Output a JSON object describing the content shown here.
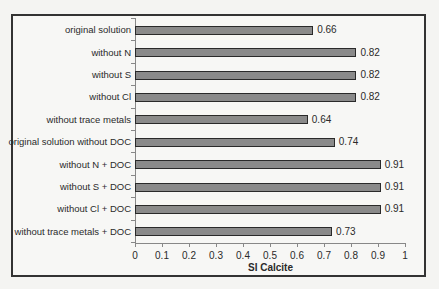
{
  "chart_data": {
    "type": "bar",
    "orientation": "horizontal",
    "title": "",
    "xlabel": "SI Calcite",
    "ylabel": "",
    "xlim": [
      0,
      1
    ],
    "xticks": [
      "0",
      "0.1",
      "0.2",
      "0.3",
      "0.4",
      "0.5",
      "0.6",
      "0.7",
      "0.8",
      "0.9",
      "1"
    ],
    "grid": false,
    "legend": null,
    "categories": [
      "original solution",
      "without N",
      "without S",
      "without Cl",
      "without trace metals",
      "original solution without DOC",
      "without N + DOC",
      "without S + DOC",
      "without Cl + DOC",
      "without trace metals + DOC"
    ],
    "values": [
      0.66,
      0.82,
      0.82,
      0.82,
      0.64,
      0.74,
      0.91,
      0.91,
      0.91,
      0.73
    ],
    "value_labels": [
      "0.66",
      "0.82",
      "0.82",
      "0.82",
      "0.64",
      "0.74",
      "0.91",
      "0.91",
      "0.91",
      "0.73"
    ],
    "bar_color": "#8a8a8a",
    "bar_border_color": "#2a2a2a"
  }
}
